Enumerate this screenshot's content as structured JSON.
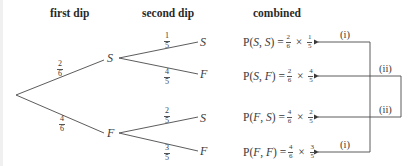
{
  "headers": {
    "first": "first dip",
    "second": "second dip",
    "combined": "combined"
  },
  "nodes": {
    "first_S": "S",
    "first_F": "F",
    "leaf_SS": "S",
    "leaf_SF": "F",
    "leaf_FS": "S",
    "leaf_FF": "F"
  },
  "branch_probs": {
    "root_S": {
      "num": "2",
      "den": "6"
    },
    "root_F": {
      "num": "4",
      "den": "6"
    },
    "S_S": {
      "num": "1",
      "den": "5"
    },
    "S_F": {
      "num": "4",
      "den": "5"
    },
    "F_S": {
      "num": "2",
      "den": "5"
    },
    "F_F": {
      "num": "3",
      "den": "5"
    }
  },
  "equations": [
    {
      "prefix": "P(",
      "a": "S",
      "sep": ", ",
      "b": "S",
      "suffix": ") =",
      "f1": {
        "num": "2",
        "den": "6"
      },
      "times": "×",
      "f2": {
        "num": "1",
        "den": "5"
      }
    },
    {
      "prefix": "P(",
      "a": "S",
      "sep": ", ",
      "b": "F",
      "suffix": ") =",
      "f1": {
        "num": "2",
        "den": "6"
      },
      "times": "×",
      "f2": {
        "num": "4",
        "den": "5"
      }
    },
    {
      "prefix": "P(",
      "a": "F",
      "sep": ", ",
      "b": "S",
      "suffix": ") =",
      "f1": {
        "num": "4",
        "den": "6"
      },
      "times": "×",
      "f2": {
        "num": "2",
        "den": "5"
      }
    },
    {
      "prefix": "P(",
      "a": "F",
      "sep": ", ",
      "b": "F",
      "suffix": ") =",
      "f1": {
        "num": "4",
        "den": "6"
      },
      "times": "×",
      "f2": {
        "num": "3",
        "den": "5"
      }
    }
  ],
  "connector_labels": {
    "row1": "(i)",
    "row2": "(ii)",
    "row3": "(ii)",
    "row4": "(i)"
  },
  "colors": {
    "line": "#4a4a4a",
    "text": "#3a3a3a"
  }
}
